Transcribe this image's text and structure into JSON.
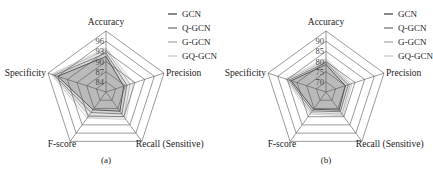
{
  "figure": {
    "captions": [
      "(a)",
      "(b)"
    ]
  },
  "legend": {
    "items": [
      {
        "label": "GCN",
        "color": "#3a3a3a"
      },
      {
        "label": "Q-GCN",
        "color": "#6a6a6a"
      },
      {
        "label": "G-GCN",
        "color": "#a8a8a8"
      },
      {
        "label": "GQ-GCN",
        "color": "#c8c8c8"
      }
    ]
  },
  "chart_data": [
    {
      "type": "radar",
      "panel": "(a)",
      "axes": [
        "Accuracy",
        "Precision",
        "Recall (Sensitive)",
        "F-score",
        "Specificity"
      ],
      "ticks": [
        84,
        87,
        90,
        93,
        96
      ],
      "range": [
        81,
        99
      ],
      "rings": 6,
      "grid": true,
      "legend_position": "top-right",
      "series": [
        {
          "name": "GCN",
          "values": [
            91.5,
            86.5,
            88.0,
            87.5,
            96.0
          ]
        },
        {
          "name": "Q-GCN",
          "values": [
            92.5,
            87.5,
            89.0,
            88.5,
            97.0
          ]
        },
        {
          "name": "G-GCN",
          "values": [
            93.5,
            88.5,
            90.0,
            89.5,
            97.5
          ]
        },
        {
          "name": "GQ-GCN",
          "values": [
            94.0,
            89.5,
            91.0,
            90.5,
            98.0
          ]
        }
      ]
    },
    {
      "type": "radar",
      "panel": "(b)",
      "axes": [
        "Accuracy",
        "Precision",
        "Recall (Sensitive)",
        "F-score",
        "Specificity"
      ],
      "ticks": [
        70,
        75,
        80,
        85,
        90
      ],
      "range": [
        65,
        95
      ],
      "rings": 6,
      "grid": true,
      "legend_position": "top-right",
      "series": [
        {
          "name": "GCN",
          "values": [
            78.5,
            75.0,
            76.0,
            75.5,
            83.0
          ]
        },
        {
          "name": "Q-GCN",
          "values": [
            79.5,
            76.5,
            77.0,
            76.5,
            84.0
          ]
        },
        {
          "name": "G-GCN",
          "values": [
            80.5,
            77.5,
            78.5,
            77.5,
            85.0
          ]
        },
        {
          "name": "GQ-GCN",
          "values": [
            81.5,
            78.5,
            79.5,
            78.5,
            86.0
          ]
        }
      ]
    }
  ]
}
